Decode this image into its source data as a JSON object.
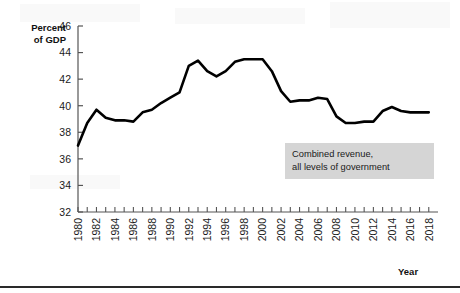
{
  "figure": {
    "y_axis_title_line1": "Percent",
    "y_axis_title_line2": "of GDP",
    "x_axis_title": "Year",
    "annotation_line1": "Combined revenue,",
    "annotation_line2": "all levels of government",
    "annotation_bg": "#d5d5d5",
    "line_color": "#000000",
    "axis_color": "#555555",
    "background": "#ffffff"
  },
  "chart_data": {
    "type": "line",
    "title": "",
    "subtitle": "",
    "xlabel": "Year",
    "ylabel": "Percent of GDP",
    "ylim": [
      32,
      46
    ],
    "xlim": [
      1980,
      2019
    ],
    "yticks": [
      32,
      34,
      36,
      38,
      40,
      42,
      44,
      46
    ],
    "ytick_labels": [
      "32",
      "34",
      "36",
      "38",
      "40",
      "42",
      "44",
      "46"
    ],
    "xticks": [
      1980,
      1982,
      1984,
      1986,
      1988,
      1990,
      1992,
      1994,
      1996,
      1998,
      2000,
      2002,
      2004,
      2006,
      2008,
      2010,
      2012,
      2014,
      2016,
      2018
    ],
    "xtick_labels": [
      "1980",
      "1982",
      "1984",
      "1986",
      "1988",
      "1990",
      "1992",
      "1994",
      "1996",
      "1998",
      "2000",
      "2002",
      "2004",
      "2006",
      "2008",
      "2010",
      "2012",
      "2014",
      "2016",
      "2018"
    ],
    "xtick_minor_every": 1,
    "grid": false,
    "legend": null,
    "annotations": [
      {
        "text": "Combined revenue, all levels of government",
        "x": 2009,
        "y": 36.6
      }
    ],
    "series": [
      {
        "name": "Combined revenue, all levels of government",
        "color": "#000000",
        "x": [
          1980,
          1981,
          1982,
          1983,
          1984,
          1985,
          1986,
          1987,
          1988,
          1989,
          1990,
          1991,
          1992,
          1993,
          1994,
          1995,
          1996,
          1997,
          1998,
          1999,
          2000,
          2001,
          2002,
          2003,
          2004,
          2005,
          2006,
          2007,
          2008,
          2009,
          2010,
          2011,
          2012,
          2013,
          2014,
          2015,
          2016,
          2017,
          2018
        ],
        "values": [
          37.0,
          38.7,
          39.7,
          39.1,
          38.9,
          38.9,
          38.8,
          39.5,
          39.7,
          40.2,
          40.6,
          41.0,
          43.0,
          43.4,
          42.6,
          42.2,
          42.6,
          43.3,
          43.5,
          43.5,
          43.5,
          42.6,
          41.1,
          40.3,
          40.4,
          40.4,
          40.6,
          40.5,
          39.2,
          38.7,
          38.7,
          38.8,
          38.8,
          39.6,
          39.9,
          39.6,
          39.5,
          39.5,
          39.5
        ]
      }
    ]
  }
}
